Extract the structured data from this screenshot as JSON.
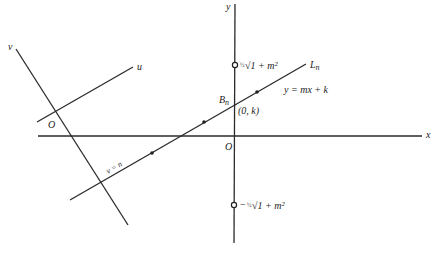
{
  "diagram": {
    "axes": {
      "x_label": "x",
      "y_label": "y",
      "origin_label": "O"
    },
    "rotated_axes": {
      "u_label": "u",
      "v_label": "v",
      "origin_label": "O"
    },
    "line": {
      "name_label": "L",
      "name_subscript": "n",
      "equation_label": "y = mx + k",
      "constraint_label": "v = n",
      "intercept_point_label": "B",
      "intercept_point_subscript": "n",
      "intercept_coords_label": "(0, k)"
    },
    "markers": {
      "upper_frac": "½",
      "upper_radical": "√1 + m²",
      "lower_sign": "−",
      "lower_frac": "½",
      "lower_radical": "√1 + m²"
    }
  }
}
